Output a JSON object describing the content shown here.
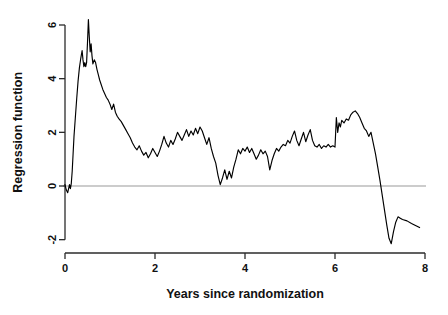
{
  "chart_data": {
    "type": "line",
    "title": "",
    "subtitle": "",
    "xlabel": "Years since randomization",
    "ylabel": "Regression function",
    "xlim": [
      -0.15,
      8.15
    ],
    "ylim": [
      -2.6,
      6.55
    ],
    "xticks": [
      0,
      2,
      4,
      6,
      8
    ],
    "xticklabels": [
      "0",
      "2",
      "4",
      "6",
      "8"
    ],
    "yticks": [
      -2,
      0,
      2,
      4,
      6
    ],
    "yticklabels": [
      "-2",
      "0",
      "2",
      "4",
      "6"
    ],
    "grid": false,
    "legend": null,
    "annotations": [
      {
        "name": "zero-reference-line",
        "type": "hline",
        "y": 0,
        "color": "#9a9a9a"
      }
    ],
    "line_color": "#000000",
    "series": [
      {
        "name": "Regression function estimate",
        "x": [
          0.0,
          0.03,
          0.06,
          0.08,
          0.1,
          0.12,
          0.14,
          0.16,
          0.18,
          0.2,
          0.23,
          0.26,
          0.29,
          0.32,
          0.35,
          0.38,
          0.4,
          0.42,
          0.44,
          0.46,
          0.48,
          0.5,
          0.52,
          0.54,
          0.56,
          0.58,
          0.6,
          0.62,
          0.65,
          0.68,
          0.71,
          0.74,
          0.77,
          0.8,
          0.84,
          0.88,
          0.92,
          0.96,
          1.0,
          1.04,
          1.08,
          1.12,
          1.16,
          1.2,
          1.25,
          1.3,
          1.35,
          1.4,
          1.45,
          1.5,
          1.55,
          1.6,
          1.65,
          1.7,
          1.75,
          1.8,
          1.85,
          1.9,
          1.95,
          2.0,
          2.05,
          2.1,
          2.15,
          2.2,
          2.25,
          2.3,
          2.35,
          2.4,
          2.45,
          2.5,
          2.55,
          2.6,
          2.65,
          2.7,
          2.75,
          2.8,
          2.85,
          2.9,
          2.95,
          3.0,
          3.05,
          3.1,
          3.15,
          3.2,
          3.25,
          3.3,
          3.35,
          3.4,
          3.45,
          3.5,
          3.55,
          3.6,
          3.65,
          3.7,
          3.75,
          3.8,
          3.85,
          3.9,
          3.95,
          4.0,
          4.05,
          4.1,
          4.15,
          4.2,
          4.25,
          4.3,
          4.35,
          4.4,
          4.45,
          4.5,
          4.55,
          4.6,
          4.65,
          4.7,
          4.75,
          4.8,
          4.85,
          4.9,
          4.95,
          5.0,
          5.05,
          5.1,
          5.15,
          5.2,
          5.25,
          5.3,
          5.35,
          5.4,
          5.45,
          5.5,
          5.55,
          5.6,
          5.65,
          5.7,
          5.75,
          5.8,
          5.85,
          5.9,
          5.95,
          6.0,
          6.03,
          6.06,
          6.09,
          6.12,
          6.15,
          6.2,
          6.25,
          6.3,
          6.35,
          6.4,
          6.45,
          6.5,
          6.55,
          6.6,
          6.65,
          6.7,
          6.75,
          6.8,
          6.85,
          6.9,
          6.95,
          7.0,
          7.05,
          7.1,
          7.15,
          7.2,
          7.25,
          7.3,
          7.35,
          7.4,
          7.45,
          7.5,
          7.6,
          7.7,
          7.8,
          7.88
        ],
        "y": [
          0.05,
          -0.15,
          -0.25,
          -0.1,
          0.05,
          -0.1,
          0.1,
          0.55,
          1.2,
          1.85,
          2.55,
          3.25,
          3.9,
          4.4,
          4.75,
          5.05,
          4.7,
          4.45,
          4.6,
          4.45,
          4.6,
          5.35,
          6.2,
          5.55,
          5.0,
          5.3,
          4.85,
          4.55,
          4.7,
          4.6,
          4.35,
          4.15,
          3.95,
          3.8,
          3.6,
          3.45,
          3.3,
          3.2,
          3.05,
          2.85,
          3.05,
          2.75,
          2.6,
          2.5,
          2.4,
          2.25,
          2.1,
          1.95,
          1.8,
          1.6,
          1.45,
          1.35,
          1.5,
          1.3,
          1.15,
          1.25,
          1.05,
          1.2,
          1.4,
          1.25,
          1.1,
          1.3,
          1.55,
          1.85,
          1.6,
          1.45,
          1.7,
          1.55,
          1.75,
          2.0,
          1.85,
          1.7,
          1.9,
          2.1,
          1.85,
          2.05,
          1.9,
          2.15,
          1.95,
          2.2,
          2.05,
          1.8,
          1.55,
          1.8,
          1.4,
          1.1,
          0.85,
          0.4,
          0.05,
          0.3,
          0.6,
          0.25,
          0.55,
          0.3,
          0.7,
          1.0,
          1.35,
          1.2,
          1.4,
          1.3,
          1.45,
          1.25,
          1.4,
          1.2,
          1.0,
          1.15,
          1.35,
          1.2,
          1.3,
          1.1,
          0.6,
          0.95,
          1.2,
          1.4,
          1.3,
          1.45,
          1.55,
          1.5,
          1.7,
          1.6,
          1.85,
          2.05,
          1.7,
          1.5,
          1.75,
          2.0,
          1.65,
          1.9,
          2.1,
          1.7,
          1.5,
          1.45,
          1.55,
          1.4,
          1.5,
          1.45,
          1.55,
          1.45,
          1.5,
          1.45,
          2.55,
          2.0,
          2.35,
          2.2,
          2.45,
          2.35,
          2.5,
          2.45,
          2.65,
          2.75,
          2.8,
          2.7,
          2.55,
          2.35,
          2.15,
          2.05,
          1.85,
          2.0,
          1.6,
          1.2,
          0.7,
          0.2,
          -0.35,
          -0.9,
          -1.45,
          -1.95,
          -2.15,
          -1.7,
          -1.35,
          -1.15,
          -1.2,
          -1.25,
          -1.3,
          -1.4,
          -1.48,
          -1.55
        ]
      }
    ]
  },
  "figure": {
    "background_color": "#ffffff",
    "axis_color": "#2b2b2b",
    "zero_line_color": "#9a9a9a",
    "curve_color": "#000000"
  }
}
